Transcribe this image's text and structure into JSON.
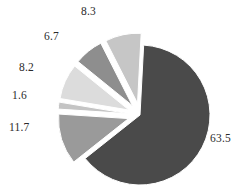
{
  "chart_data": {
    "type": "pie",
    "title": "",
    "subtitle": "",
    "xlabel": "",
    "ylabel": "",
    "legend": "none",
    "grid": false,
    "labels_shown": true,
    "label_format": "value",
    "exploded": true,
    "total": 100.0,
    "categories": [
      "63.5",
      "11.7",
      "1.6",
      "8.2",
      "6.7",
      "8.3"
    ],
    "values": [
      63.5,
      11.7,
      1.6,
      8.2,
      6.7,
      8.3
    ],
    "slices": [
      {
        "label": "63.5",
        "value": 63.5,
        "color": "#4a4a4a",
        "start_angle": -87,
        "sweep": 228.6,
        "explode": 0,
        "label_x": 210,
        "label_y": 133
      },
      {
        "label": "11.7",
        "value": 11.7,
        "color": "#9a9a9a",
        "start_angle": 141.6,
        "sweep": 42.1,
        "explode": 12,
        "label_x": 9,
        "label_y": 122
      },
      {
        "label": "1.6",
        "value": 1.6,
        "color": "#c4c4c4",
        "start_angle": 183.7,
        "sweep": 5.8,
        "explode": 12,
        "label_x": 12,
        "label_y": 90
      },
      {
        "label": "8.2",
        "value": 8.2,
        "color": "#dcdcdc",
        "start_angle": 189.5,
        "sweep": 29.5,
        "explode": 12,
        "label_x": 19,
        "label_y": 62
      },
      {
        "label": "6.7",
        "value": 6.7,
        "color": "#8e8e8e",
        "start_angle": 219.0,
        "sweep": 24.1,
        "explode": 12,
        "label_x": 44,
        "label_y": 31
      },
      {
        "label": "8.3",
        "value": 8.3,
        "color": "#c6c6c6",
        "start_angle": 243.1,
        "sweep": 29.9,
        "explode": 12,
        "label_x": 81,
        "label_y": 6
      }
    ],
    "geometry": {
      "center_x": 140,
      "center_y": 115,
      "radius": 70,
      "background": "#ffffff"
    },
    "colors": {
      "background": "#ffffff",
      "label_text": "#2b2b2b",
      "slice_1": "#4a4a4a",
      "slice_2": "#9a9a9a",
      "slice_3": "#c4c4c4",
      "slice_4": "#dcdcdc",
      "slice_5": "#8e8e8e",
      "slice_6": "#c6c6c6"
    }
  }
}
